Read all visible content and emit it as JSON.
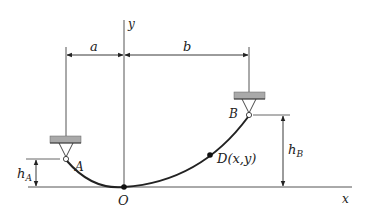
{
  "diagram": {
    "axes": {
      "x_label": "x",
      "y_label": "y",
      "origin_label": "O"
    },
    "dimensions": {
      "a": "a",
      "b": "b",
      "hA": "h",
      "hA_sub": "A",
      "hB": "h",
      "hB_sub": "B"
    },
    "points": {
      "A": "A",
      "B": "B",
      "D": "D(x,y)"
    },
    "colors": {
      "line": "#222222",
      "support": "#a9a9a9",
      "support_edge": "#555555"
    }
  }
}
